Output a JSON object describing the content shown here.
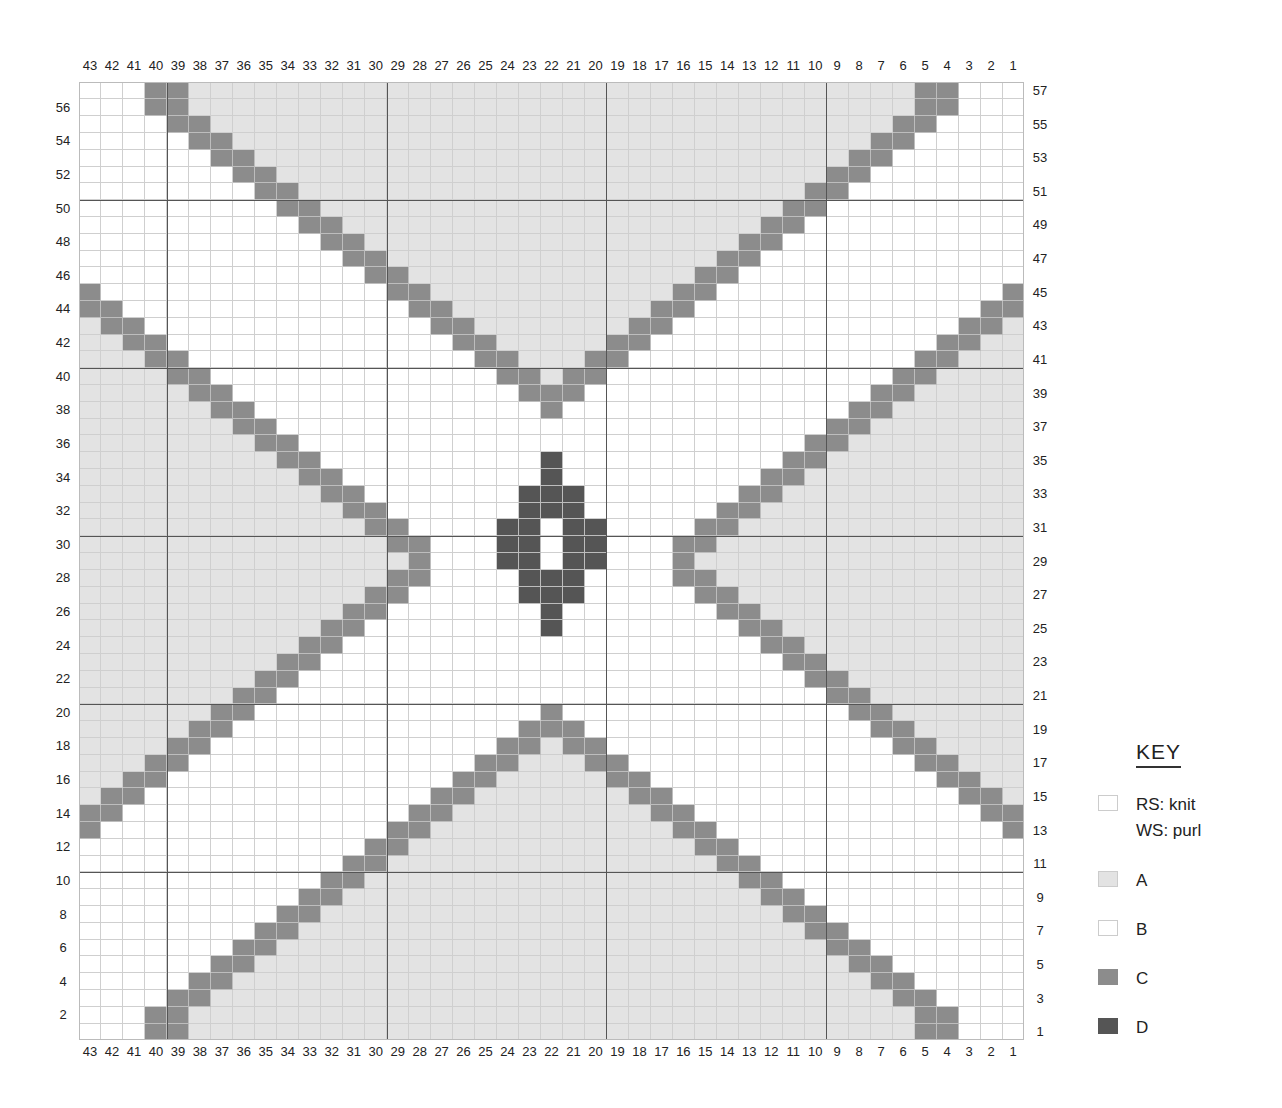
{
  "chart_data": {
    "type": "heatmap",
    "columns": 43,
    "rows": 57,
    "column_labels_order": "43 to 1, left to right (shown top and bottom)",
    "row_labels": {
      "left": "even rows 2-56",
      "right": "odd rows 1-57"
    },
    "colors": {
      "A": "#e3e3e3",
      "B": "#ffffff",
      "C": "#8c8c8c",
      "D": "#555555"
    },
    "pattern_rules": {
      "top_v": "rows 40-57: C at cols (r-16,r-17) and mirrored (44-c); row 57 same as 56; row 39: cols 23,22,21; row 38: col 22; fill A inside V above arms",
      "bottom_v": "mirror of top_v about row 29 (row r ~ row 58-r)",
      "side_x_arms": "rows 13-45: C at cols (r-1,r-2) for r>=29 and mirrored vertically about row 29; tip row 29 col 28; mirrored horizontally (44-c); fill A outside arms toward edges",
      "center_motif_D": {
        "35": [
          22
        ],
        "34": [
          22
        ],
        "33": [
          23,
          22,
          21
        ],
        "32": [
          23,
          22,
          21
        ],
        "31": [
          24,
          23,
          21,
          20
        ],
        "30": [
          24,
          23,
          21,
          20
        ],
        "29": [
          24,
          23,
          21,
          20
        ],
        "28": [
          23,
          22,
          21
        ],
        "27": [
          23,
          22,
          21
        ],
        "26": [
          22
        ],
        "25": [
          22
        ]
      }
    },
    "major_gridlines": {
      "columns_after": [
        40,
        30,
        20,
        10
      ],
      "rows_between": [
        10,
        20,
        30,
        40,
        50
      ]
    }
  },
  "key": {
    "title": "KEY",
    "items": [
      {
        "label": "RS: knit\nWS: purl",
        "color": "#ffffff"
      },
      {
        "label": "A",
        "color": "#e3e3e3"
      },
      {
        "label": "B",
        "color": "#ffffff"
      },
      {
        "label": "C",
        "color": "#8c8c8c"
      },
      {
        "label": "D",
        "color": "#555555"
      }
    ]
  }
}
